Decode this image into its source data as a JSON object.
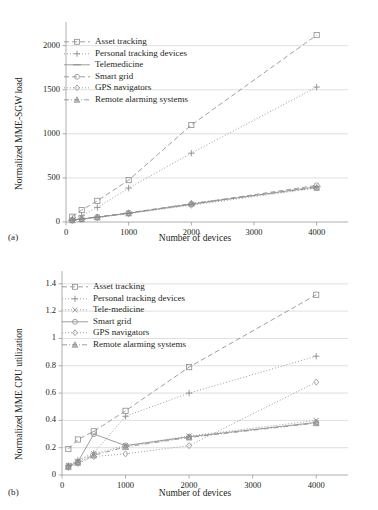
{
  "figure": {
    "background": "#ffffff",
    "ink": "#231f20",
    "grid_color": "#c9c9c9",
    "axis_color": "#9a9a9a",
    "series_color": "#8d8d8d"
  },
  "panels": [
    {
      "id": "a",
      "label": "(a)",
      "chart_data": {
        "type": "line",
        "title": "",
        "xlabel": "Number of devices",
        "ylabel": "Normalized MME-SGW load",
        "x": [
          100,
          250,
          500,
          1000,
          2000,
          4000
        ],
        "xlim": [
          0,
          4500
        ],
        "ylim": [
          0,
          2200
        ],
        "xticks": [
          0,
          1000,
          2000,
          3000,
          4000
        ],
        "xtick_labels": [
          "0",
          "1000",
          "2000",
          "3000",
          "4000"
        ],
        "yticks": [
          0,
          500,
          1000,
          1500,
          2000
        ],
        "ytick_labels": [
          "0",
          "500",
          "1000",
          "1500",
          "2000"
        ],
        "grid": "horizontal",
        "legend_position": "upper-left",
        "series": [
          {
            "name": "Asset tracking",
            "marker": "square",
            "dash": "dashed",
            "values": [
              60,
              135,
              240,
              475,
              1100,
              2120
            ]
          },
          {
            "name": "Personal tracking devices",
            "marker": "plus",
            "dash": "dotted",
            "values": [
              40,
              75,
              165,
              385,
              780,
              1530
            ]
          },
          {
            "name": "Telemedicine",
            "marker": "line",
            "dash": "solid",
            "values": [
              20,
              35,
              55,
              100,
              200,
              400
            ]
          },
          {
            "name": "Smart grid",
            "marker": "circle",
            "dash": "dashed",
            "values": [
              22,
              38,
              58,
              105,
              205,
              415
            ]
          },
          {
            "name": "GPS navigators",
            "marker": "diamond",
            "dash": "dotted",
            "values": [
              18,
              30,
              50,
              95,
              190,
              385
            ]
          },
          {
            "name": "Remote alarming systems",
            "marker": "triangle",
            "dash": "dashdot",
            "values": [
              20,
              33,
              52,
              98,
              210,
              390
            ]
          }
        ]
      }
    },
    {
      "id": "b",
      "label": "(b)",
      "chart_data": {
        "type": "line",
        "title": "",
        "xlabel": "Number of devices",
        "ylabel": "Normalized MME CPU utilization",
        "x": [
          100,
          250,
          500,
          1000,
          2000,
          4000
        ],
        "xlim": [
          0,
          4500
        ],
        "ylim": [
          0,
          1.45
        ],
        "xticks": [
          0,
          1000,
          2000,
          3000,
          4000
        ],
        "xtick_labels": [
          "0",
          "1000",
          "2000",
          "3000",
          "4000"
        ],
        "yticks": [
          0,
          0.2,
          0.4,
          0.6,
          0.8,
          1.0,
          1.2,
          1.4
        ],
        "ytick_labels": [
          "0",
          "0.2",
          "0.4",
          "0.6",
          "0.8",
          "1",
          "1.2",
          "1.4"
        ],
        "grid": "horizontal",
        "legend_position": "upper-left",
        "series": [
          {
            "name": "Asset tracking",
            "marker": "square",
            "dash": "dashed",
            "values": [
              0.19,
              0.26,
              0.32,
              0.47,
              0.79,
              1.32
            ]
          },
          {
            "name": "Personal tracking devices",
            "marker": "plus",
            "dash": "dotted",
            "values": [
              0.07,
              0.11,
              0.16,
              0.43,
              0.6,
              0.87
            ]
          },
          {
            "name": "Tele-medicine",
            "marker": "cross",
            "dash": "dotted",
            "values": [
              0.07,
              0.1,
              0.155,
              0.215,
              0.285,
              0.4
            ]
          },
          {
            "name": "Smart grid",
            "marker": "circle",
            "dash": "solid",
            "values": [
              0.065,
              0.095,
              0.3,
              0.215,
              0.28,
              0.385
            ]
          },
          {
            "name": "GPS navigators",
            "marker": "diamond",
            "dash": "dotted",
            "values": [
              0.055,
              0.085,
              0.135,
              0.155,
              0.215,
              0.68
            ]
          },
          {
            "name": "Remote alarming systems",
            "marker": "triangle",
            "dash": "dashdot",
            "values": [
              0.06,
              0.09,
              0.145,
              0.205,
              0.275,
              0.38
            ]
          }
        ]
      }
    }
  ]
}
